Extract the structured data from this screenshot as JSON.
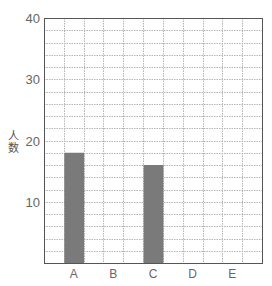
{
  "chart_data": {
    "type": "bar",
    "title": "",
    "xlabel": "",
    "ylabel": "人数",
    "categories": [
      "A",
      "B",
      "C",
      "D",
      "E"
    ],
    "values": [
      18,
      0,
      16,
      0,
      0
    ],
    "ylim": [
      0,
      40
    ],
    "yticks": [
      10,
      20,
      30,
      40
    ],
    "grid": true,
    "grid_minor_step": 2,
    "legend": null,
    "bar_color": "#7a7a7a"
  },
  "axis": {
    "ylabel_chars": [
      "人",
      "数"
    ]
  }
}
